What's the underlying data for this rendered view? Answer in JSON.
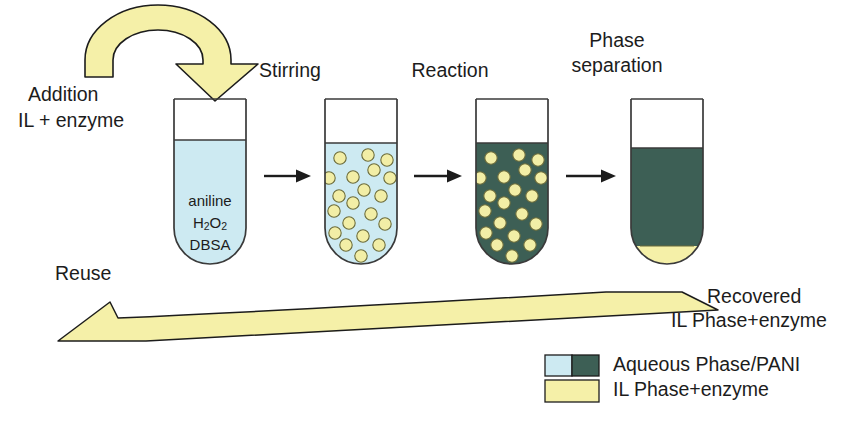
{
  "diagram": {
    "title_implicit": "Enzymatic PANI synthesis in IL biphasic system",
    "stage_labels": [
      {
        "id": "stirring",
        "text": "Stirring"
      },
      {
        "id": "reaction",
        "text": "Reaction"
      },
      {
        "id": "phase-separation-line1",
        "text": "Phase"
      },
      {
        "id": "phase-separation-line2",
        "text": "separation"
      }
    ],
    "side_labels": {
      "addition_line1": "Addition",
      "addition_line2": "IL + enzyme",
      "reuse": "Reuse",
      "recovered_line1": "Recovered",
      "recovered_line2": "IL Phase+enzyme"
    },
    "tubes": [
      {
        "id": "tube-1",
        "stage": "initial",
        "liquid": "aqueous",
        "contents_text": [
          "aniline",
          "H2O2",
          "DBSA"
        ],
        "contents_html": [
          "aniline",
          "H<sub>2</sub>O<sub>2</sub>",
          "DBSA"
        ],
        "droplet_count": 0
      },
      {
        "id": "tube-2",
        "stage": "stirring",
        "liquid": "aqueous",
        "contents_text": [],
        "droplet_count": 20
      },
      {
        "id": "tube-3",
        "stage": "reaction",
        "liquid": "pani",
        "contents_text": [],
        "droplet_count": 20
      },
      {
        "id": "tube-4",
        "stage": "phase-separated",
        "liquid": "pani",
        "contents_text": [],
        "droplet_count": 0,
        "bottom_layer": "il"
      }
    ],
    "legend": {
      "items": [
        {
          "id": "aqueous-pani",
          "label": "Aqueous Phase/PANI",
          "swatch": "two-tone"
        },
        {
          "id": "il-enzyme",
          "label": "IL Phase+enzyme",
          "swatch": "yellow"
        }
      ]
    },
    "colors": {
      "aqueous": "#cdeaf2",
      "pani": "#3d5f55",
      "il_yellow": "#f5f0a8",
      "droplet": "#f2eea6",
      "outline": "#1c1c1c",
      "tube_outline": "#3a3a3a",
      "text": "#1c1c1c",
      "background": "#ffffff"
    },
    "arrows": {
      "recycle_top": "curved-down-right",
      "step_1_2": "right",
      "step_2_3": "right",
      "step_3_4": "right",
      "recycle_bottom": "curved-left"
    }
  }
}
